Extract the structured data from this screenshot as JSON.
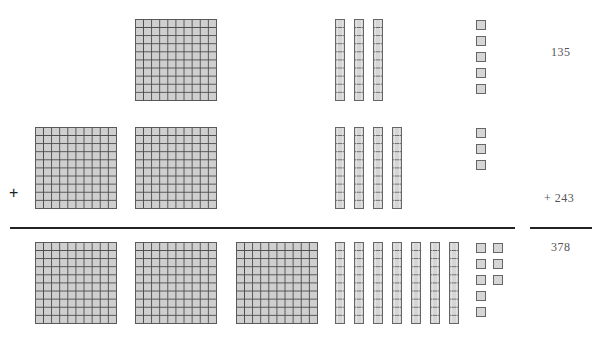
{
  "colors": {
    "block_fill": "#cfcfcf",
    "block_line": "#4a4a4a",
    "rule": "#222222",
    "text": "#555555"
  },
  "rows": [
    {
      "name": "addend-1",
      "value_label": "135",
      "hundreds": 1,
      "tens": 3,
      "ones": 5
    },
    {
      "name": "addend-2",
      "value_label": "+ 243",
      "hundreds": 2,
      "tens": 4,
      "ones": 3
    },
    {
      "name": "sum",
      "value_label": "378",
      "hundreds": 3,
      "tens": 7,
      "ones": 8
    }
  ],
  "operator": "+",
  "labels": {
    "addend1": "135",
    "addend2": "+ 243",
    "sum": "378",
    "plus": "+"
  }
}
